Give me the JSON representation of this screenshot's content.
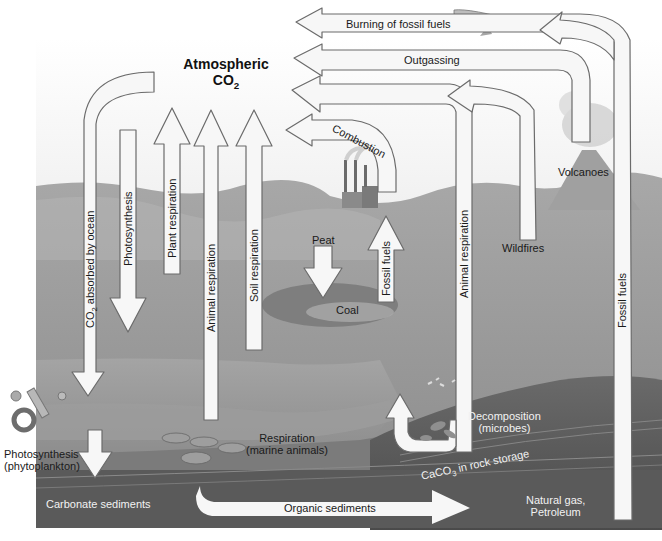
{
  "diagram": {
    "title_line1": "Atmospheric",
    "title_line2_main": "CO",
    "title_line2_sub": "2",
    "colors": {
      "sky": "#f3f3f3",
      "land": "#a3a3a3",
      "land_dark": "#8c8c8c",
      "water": "#9a9a9a",
      "sediment": "#6e6e6e",
      "deep_rock": "#4f4f4f",
      "arrow_fill": "#f7f7f7",
      "arrow_stroke": "#6b6b6b",
      "text_dark": "#1a1a1a",
      "text_light": "#f0f0f0"
    },
    "arrows_to_atmosphere": {
      "burning_fossil_fuels": "Burning of fossil fuels",
      "outgassing": "Outgassing",
      "combustion": "Combustion",
      "plant_respiration": "Plant respiration",
      "animal_respiration_land": "Animal respiration",
      "soil_respiration": "Soil respiration",
      "animal_respiration_right": "Animal respiration",
      "fossil_fuels_right": "Fossil fuels",
      "fossil_fuels_center": "Fossil fuels"
    },
    "arrows_from_atmosphere": {
      "co2_absorbed_prefix": "CO",
      "co2_absorbed_sub": "2",
      "co2_absorbed_suffix": " absorbed by ocean",
      "photosynthesis": "Photosynthesis"
    },
    "places": {
      "volcanoes": "Volcanoes",
      "wildfires": "Wildfires",
      "peat": "Peat",
      "coal": "Coal",
      "phyto_line1": "Photosynthesis",
      "phyto_line2": "(phytoplankton)",
      "marine_line1": "Respiration",
      "marine_line2": "(marine animals)",
      "decomp_line1": "Decomposition",
      "decomp_line2": "(microbes)",
      "carbonate_sediments": "Carbonate sediments",
      "organic_sediments": "Organic sediments",
      "caco3_prefix": "CaCO",
      "caco3_sub": "3",
      "caco3_suffix": " in rock storage",
      "natgas_line1": "Natural gas,",
      "natgas_line2": "Petroleum"
    }
  }
}
